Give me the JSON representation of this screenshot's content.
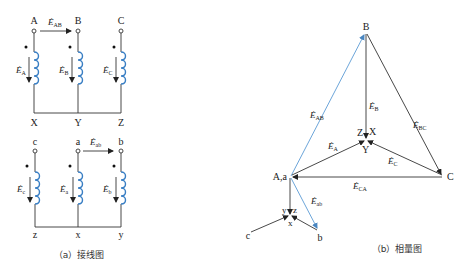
{
  "figure": {
    "panel_a": {
      "caption": "（a）接线图",
      "upper": {
        "terminals_top": [
          "A",
          "B",
          "C"
        ],
        "terminals_bottom": [
          "X",
          "Y",
          "Z"
        ],
        "emf_labels": [
          "E",
          "E",
          "E"
        ],
        "emf_subs": [
          "A",
          "B",
          "C"
        ],
        "line_emf": {
          "main": "E",
          "sub": "AB"
        }
      },
      "lower": {
        "terminals_top": [
          "c",
          "a",
          "b"
        ],
        "terminals_bottom": [
          "z",
          "x",
          "y"
        ],
        "emf_labels": [
          "E",
          "E",
          "E"
        ],
        "emf_subs": [
          "c",
          "a",
          "b"
        ],
        "line_emf": {
          "main": "E",
          "sub": "ab"
        }
      }
    },
    "panel_b": {
      "caption": "（b）相量图",
      "vertices": {
        "B": "B",
        "Aa": "A,a",
        "C": "C",
        "center_upper": [
          "Z",
          "X",
          "Y"
        ],
        "center_lower": [
          "y",
          "z",
          "x"
        ],
        "c": "c",
        "b": "b"
      },
      "vectors": [
        {
          "main": "E",
          "sub": "AB"
        },
        {
          "main": "E",
          "sub": "B"
        },
        {
          "main": "E",
          "sub": "BC"
        },
        {
          "main": "E",
          "sub": "A"
        },
        {
          "main": "E",
          "sub": "C"
        },
        {
          "main": "E",
          "sub": "CA"
        },
        {
          "main": "E",
          "sub": "ab"
        }
      ]
    },
    "colors": {
      "coil": "#3a7fc4",
      "line_vector": "#5b9bd5",
      "wire": "#333333"
    }
  }
}
